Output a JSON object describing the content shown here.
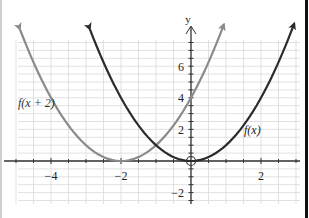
{
  "chart_data": {
    "type": "line",
    "title": "",
    "xlabel": "",
    "ylabel": "y",
    "xlim": [
      -5.0,
      3.1
    ],
    "ylim": [
      -2.6,
      8.4
    ],
    "grid": true,
    "grid_step_x": 0.5,
    "grid_step_y": 0.5,
    "x_ticks": [
      -4,
      -2,
      2
    ],
    "x_tick_labels": [
      "−4",
      "−2",
      "2"
    ],
    "y_ticks": [
      -2,
      2,
      4,
      6
    ],
    "y_tick_labels": [
      "−2",
      "2",
      "4",
      "6"
    ],
    "series": [
      {
        "name": "f(x)",
        "label": "f(x)",
        "expression": "x^2",
        "vertex": [
          0,
          0
        ],
        "color": "#2b2b2b",
        "x_range": [
          -2.89,
          2.95
        ],
        "points": [
          [
            -2.89,
            8.35
          ],
          [
            -2,
            4
          ],
          [
            -1,
            1
          ],
          [
            0,
            0
          ],
          [
            1,
            1
          ],
          [
            2,
            4
          ],
          [
            2.95,
            8.7
          ]
        ]
      },
      {
        "name": "f(x + 2)",
        "label": "f(x + 2)",
        "expression": "(x+2)^2",
        "vertex": [
          -2,
          0
        ],
        "color": "#8a8a8a",
        "x_range": [
          -4.89,
          0.94
        ],
        "points": [
          [
            -4.89,
            8.35
          ],
          [
            -4,
            4
          ],
          [
            -3,
            1
          ],
          [
            -2,
            0
          ],
          [
            -1,
            1
          ],
          [
            0,
            4
          ],
          [
            0.94,
            8.64
          ]
        ]
      }
    ],
    "annotations": [
      {
        "type": "open-circle",
        "at": [
          0,
          0
        ]
      },
      {
        "type": "label",
        "text": "f(x + 2)",
        "at": [
          -4.9,
          3.6
        ]
      },
      {
        "type": "label",
        "text": "f(x)",
        "at": [
          1.35,
          1.7
        ]
      }
    ]
  },
  "axes": {
    "y_axis_label": "y"
  },
  "labels": {
    "f_shift": "f(x + 2)",
    "f": "f(x)"
  },
  "ticks": {
    "x_neg4": "−4",
    "x_neg2": "−2",
    "x_2": "2",
    "y_6": "6",
    "y_4": "4",
    "y_2": "2",
    "y_neg2": "−2"
  },
  "colors": {
    "grid": "#d8d8d8",
    "axis": "#333333",
    "f": "#2b2b2b",
    "f_shift": "#8a8a8a"
  }
}
